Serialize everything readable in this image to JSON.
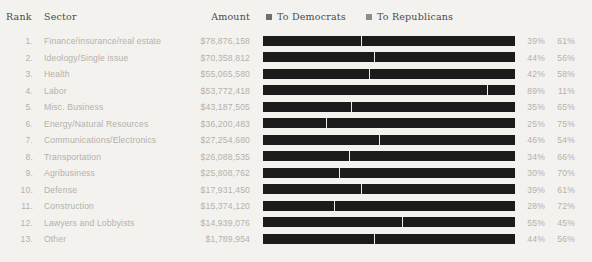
{
  "header": {
    "rank": "Rank",
    "sector": "Sector",
    "amount": "Amount"
  },
  "legend": {
    "democrats": {
      "label": "To Democrats",
      "swatch": "legend-swatch-democrats",
      "color": "#6f6f6f"
    },
    "republicans": {
      "label": "To Republicans",
      "swatch": "legend-swatch-republicans",
      "color": "#8c8c8c"
    }
  },
  "style": {
    "background": "#f4f2ee",
    "bar_color": "#1b1b1b",
    "divider_color": "#efedea",
    "body_text_color": "#b4b1ac",
    "header_text_color": "#4a4a4a"
  },
  "chart_data": {
    "type": "bar",
    "title": "",
    "subtitle": "",
    "xlabel": "",
    "ylabel": "",
    "orientation": "horizontal",
    "stacked": true,
    "normalized": true,
    "xlim": [
      0,
      100
    ],
    "grid": false,
    "legend_position": "top-right",
    "categories": [
      "Finance/insurance/real estate",
      "Ideology/Single issue",
      "Health",
      "Labor",
      "Misc. Business",
      "Energy/Natural Resources",
      "Communications/Electronics",
      "Transportation",
      "Agribusiness",
      "Defense",
      "Construction",
      "Lawyers and Lobbyists",
      "Other"
    ],
    "series": [
      {
        "name": "To Democrats",
        "values": [
          39,
          44,
          42,
          89,
          35,
          25,
          46,
          34,
          30,
          39,
          28,
          55,
          44
        ]
      },
      {
        "name": "To Republicans",
        "values": [
          61,
          56,
          58,
          11,
          65,
          75,
          54,
          66,
          70,
          61,
          72,
          45,
          56
        ]
      }
    ],
    "rows": [
      {
        "rank": "1.",
        "sector": "Finance/insurance/real estate",
        "amount": "$78,876,158",
        "amount_value": 78876158,
        "dem_pct": "39%",
        "rep_pct": "61%",
        "dem_value": 39,
        "rep_value": 61
      },
      {
        "rank": "2.",
        "sector": "Ideology/Single issue",
        "amount": "$70,358,812",
        "amount_value": 70358812,
        "dem_pct": "44%",
        "rep_pct": "56%",
        "dem_value": 44,
        "rep_value": 56
      },
      {
        "rank": "3.",
        "sector": "Health",
        "amount": "$55,065,580",
        "amount_value": 55065580,
        "dem_pct": "42%",
        "rep_pct": "58%",
        "dem_value": 42,
        "rep_value": 58
      },
      {
        "rank": "4.",
        "sector": "Labor",
        "amount": "$53,772,418",
        "amount_value": 53772418,
        "dem_pct": "89%",
        "rep_pct": "11%",
        "dem_value": 89,
        "rep_value": 11
      },
      {
        "rank": "5.",
        "sector": "Misc. Business",
        "amount": "$43,187,505",
        "amount_value": 43187505,
        "dem_pct": "35%",
        "rep_pct": "65%",
        "dem_value": 35,
        "rep_value": 65
      },
      {
        "rank": "6.",
        "sector": "Energy/Natural Resources",
        "amount": "$36,200,483",
        "amount_value": 36200483,
        "dem_pct": "25%",
        "rep_pct": "75%",
        "dem_value": 25,
        "rep_value": 75
      },
      {
        "rank": "7.",
        "sector": "Communications/Electronics",
        "amount": "$27,254,680",
        "amount_value": 27254680,
        "dem_pct": "46%",
        "rep_pct": "54%",
        "dem_value": 46,
        "rep_value": 54
      },
      {
        "rank": "8.",
        "sector": "Transportation",
        "amount": "$26,088,535",
        "amount_value": 26088535,
        "dem_pct": "34%",
        "rep_pct": "66%",
        "dem_value": 34,
        "rep_value": 66
      },
      {
        "rank": "9.",
        "sector": "Agribusiness",
        "amount": "$25,808,762",
        "amount_value": 25808762,
        "dem_pct": "30%",
        "rep_pct": "70%",
        "dem_value": 30,
        "rep_value": 70
      },
      {
        "rank": "10.",
        "sector": "Defense",
        "amount": "$17,931,450",
        "amount_value": 17931450,
        "dem_pct": "39%",
        "rep_pct": "61%",
        "dem_value": 39,
        "rep_value": 61
      },
      {
        "rank": "11.",
        "sector": "Construction",
        "amount": "$15,374,120",
        "amount_value": 15374120,
        "dem_pct": "28%",
        "rep_pct": "72%",
        "dem_value": 28,
        "rep_value": 72
      },
      {
        "rank": "12.",
        "sector": "Lawyers and Lobbyists",
        "amount": "$14,939,076",
        "amount_value": 14939076,
        "dem_pct": "55%",
        "rep_pct": "45%",
        "dem_value": 55,
        "rep_value": 45
      },
      {
        "rank": "13.",
        "sector": "Other",
        "amount": "$1,789,954",
        "amount_value": 1789954,
        "dem_pct": "44%",
        "rep_pct": "56%",
        "dem_value": 44,
        "rep_value": 56
      }
    ]
  }
}
